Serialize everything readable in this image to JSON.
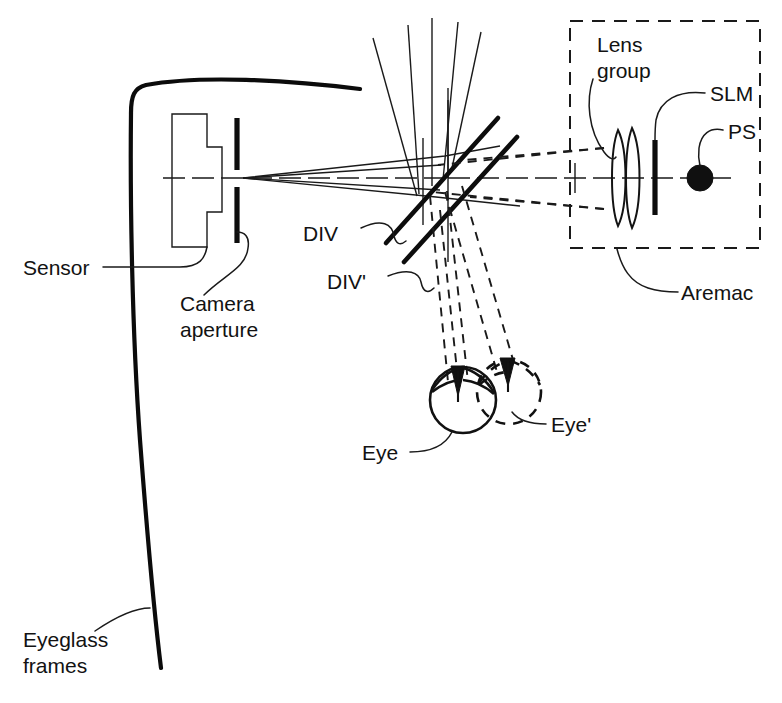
{
  "figure": {
    "title": "Eyeglass-based aremac and camera optical path diagram",
    "width": 782,
    "height": 703,
    "background_color": "#ffffff",
    "ink_color": "#111111"
  },
  "labels": {
    "sensor": "Sensor",
    "camera_aperture_line1": "Camera",
    "camera_aperture_line2": "aperture",
    "eyeglass_frames_line1": "Eyeglass",
    "eyeglass_frames_line2": "frames",
    "div": "DIV",
    "div_prime": "DIV'",
    "lens_group_line1": "Lens",
    "lens_group_line2": "group",
    "slm": "SLM",
    "ps": "PS",
    "aremac": "Aremac",
    "eye": "Eye",
    "eye_prime": "Eye'"
  },
  "components": [
    {
      "name": "eyeglass-frames",
      "label": "Eyeglass frames",
      "kind": "outline",
      "description": "Curved top rim and long vertical temple arm of eyeglass frame at left"
    },
    {
      "name": "sensor",
      "label": "Sensor",
      "kind": "stepped-block",
      "description": "Stepped rectangular image sensor body behind the camera aperture"
    },
    {
      "name": "camera-aperture",
      "label": "Camera aperture",
      "kind": "slit",
      "description": "Two vertical bars forming an aperture slit on the optical axis"
    },
    {
      "name": "div",
      "label": "DIV",
      "kind": "beamsplitter",
      "description": "Lower diverter / beam splitter plate oriented at 45 degrees"
    },
    {
      "name": "div-prime",
      "label": "DIV'",
      "kind": "beamsplitter",
      "description": "Upper diverter / beam splitter plate oriented at 45 degrees"
    },
    {
      "name": "lens-group",
      "label": "Lens group",
      "kind": "lens-doublet",
      "description": "Two lens elements inside the aremac enclosure"
    },
    {
      "name": "slm",
      "label": "SLM",
      "kind": "vertical-bar",
      "description": "Spatial light modulator shown as a vertical bar"
    },
    {
      "name": "ps",
      "label": "PS",
      "kind": "point-source",
      "description": "Point source drawn as a filled black disc"
    },
    {
      "name": "aremac",
      "label": "Aremac",
      "kind": "dashed-enclosure",
      "description": "Dashed rectangle enclosing the lens group, SLM and point source"
    },
    {
      "name": "eye",
      "label": "Eye",
      "kind": "eye-solid",
      "description": "Solid circular eye with iris arc at first position"
    },
    {
      "name": "eye-prime",
      "label": "Eye'",
      "kind": "eye-dashed",
      "description": "Dashed circular eye at displaced second position"
    }
  ],
  "rays": {
    "solid_description": "Solid rays converge from the beam splitters to the camera aperture and fan upward beyond the splitters",
    "dashed_description": "Dashed rays travel from the aremac through the beam splitters and converge downward onto the Eye and Eye' pupils",
    "axis_description": "Dash-dot optical axis runs horizontally through sensor, aperture, splitters, lens group, SLM and PS"
  }
}
